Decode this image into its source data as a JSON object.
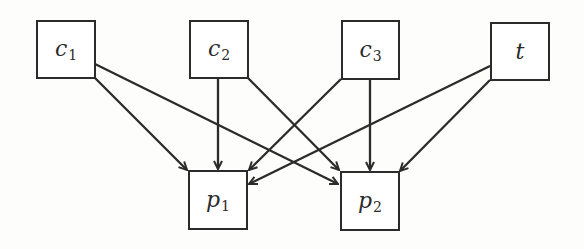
{
  "diagram": {
    "type": "directed-graph",
    "nodes": [
      {
        "id": "c1",
        "base": "c",
        "sub": "1"
      },
      {
        "id": "c2",
        "base": "c",
        "sub": "2"
      },
      {
        "id": "c3",
        "base": "c",
        "sub": "3"
      },
      {
        "id": "t",
        "base": "t",
        "sub": ""
      },
      {
        "id": "p1",
        "base": "p",
        "sub": "1"
      },
      {
        "id": "p2",
        "base": "p",
        "sub": "2"
      }
    ],
    "edges": [
      {
        "from": "c1",
        "to": "p1"
      },
      {
        "from": "c1",
        "to": "p2"
      },
      {
        "from": "c2",
        "to": "p1"
      },
      {
        "from": "c2",
        "to": "p2"
      },
      {
        "from": "c3",
        "to": "p1"
      },
      {
        "from": "c3",
        "to": "p2"
      },
      {
        "from": "t",
        "to": "p1"
      },
      {
        "from": "t",
        "to": "p2"
      }
    ]
  }
}
